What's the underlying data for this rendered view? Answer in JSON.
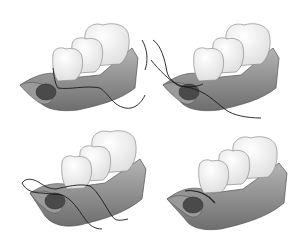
{
  "figure": {
    "colors": {
      "background": "#ffffff",
      "gum": "#8a8a8a",
      "gum_dark": "#5e5e5e",
      "gum_light": "#b8b8b8",
      "tooth": "#f4f4f4",
      "tooth_outline": "#8c8c8c",
      "socket": "#4a4a4a",
      "suture": "#1a1a1a"
    },
    "panels": [
      {
        "step": 1,
        "position": "top-left",
        "label": "needle-through-buccal-flap"
      },
      {
        "step": 2,
        "position": "top-right",
        "label": "suture-crossed-over-socket"
      },
      {
        "step": 3,
        "position": "bottom-left",
        "label": "suture-looped-around-tooth"
      },
      {
        "step": 4,
        "position": "bottom-right",
        "label": "suture-tied-knot"
      }
    ]
  }
}
